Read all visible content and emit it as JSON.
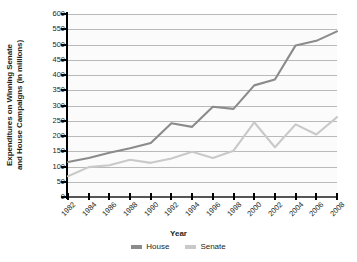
{
  "chart_data": {
    "type": "line",
    "title": "",
    "xlabel": "Year",
    "ylabel": "Expenditures on Winning Senate and House Campaigns (in millions)",
    "ylabel_line1": "Expenditures on Winning Senate",
    "ylabel_line2": "and House Campaigns (in millions)",
    "x": [
      1982,
      1984,
      1986,
      1988,
      1990,
      1992,
      1994,
      1996,
      1998,
      2000,
      2002,
      2004,
      2006,
      2008
    ],
    "categories": [
      "1982",
      "1984",
      "1986",
      "1988",
      "1990",
      "1992",
      "1994",
      "1996",
      "1998",
      "2000",
      "2002",
      "2004",
      "2006",
      "2008"
    ],
    "ylim": [
      0,
      600
    ],
    "yticks": [
      0,
      50,
      100,
      150,
      200,
      250,
      300,
      350,
      400,
      450,
      500,
      550,
      600
    ],
    "ytick_labels": [
      "0",
      "50",
      "100",
      "150",
      "200",
      "250",
      "300",
      "350",
      "400",
      "450",
      "500",
      "550",
      "600"
    ],
    "grid": true,
    "legend_position": "bottom",
    "series": [
      {
        "name": "House",
        "color": "#8b8b8b",
        "values": [
          115,
          128,
          145,
          160,
          177,
          242,
          230,
          296,
          289,
          366,
          385,
          497,
          512,
          543
        ]
      },
      {
        "name": "Senate",
        "color": "#c9c9c9",
        "values": [
          68,
          98,
          104,
          122,
          112,
          126,
          148,
          128,
          152,
          245,
          163,
          238,
          205,
          262
        ]
      }
    ]
  },
  "legend": {
    "items": [
      {
        "label": "House",
        "color": "#8b8b8b"
      },
      {
        "label": "Senate",
        "color": "#c9c9c9"
      }
    ]
  },
  "axes": {
    "x_title": "Year",
    "y_title_line1": "Expenditures on Winning Senate",
    "y_title_line2": "and House Campaigns (in millions)"
  }
}
